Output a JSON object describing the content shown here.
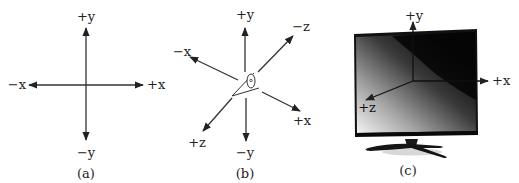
{
  "figure": {
    "panels": [
      {
        "id": "a",
        "caption": "(a)",
        "labels": {
          "pos_y": "+y",
          "neg_y": "−y",
          "pos_x": "+x",
          "neg_x": "−x"
        }
      },
      {
        "id": "b",
        "caption": "(b)",
        "labels": {
          "pos_y": "+y",
          "neg_y": "−y",
          "pos_x": "+x",
          "neg_x": "−x",
          "pos_z": "+z",
          "neg_z": "−z"
        },
        "center_icon": "eye-icon"
      },
      {
        "id": "c",
        "caption": "(c)",
        "labels": {
          "pos_y": "+y",
          "pos_x": "+x",
          "pos_z": "+z"
        },
        "object": "tv-monitor"
      }
    ],
    "colors": {
      "axis": "#333333",
      "text": "#222222",
      "screen_dark": "#0a0a0a",
      "screen_light": "#f2f2f2"
    }
  }
}
